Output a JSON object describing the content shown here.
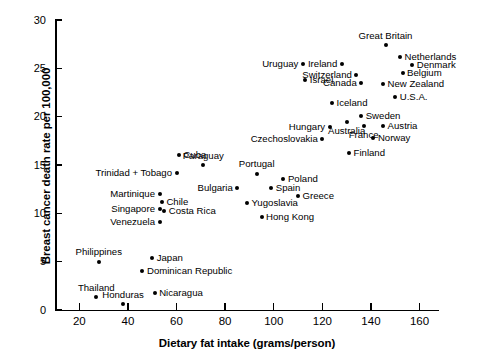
{
  "chart_data": {
    "type": "scatter",
    "title": "",
    "xlabel": "Dietary fat intake (grams/person)",
    "ylabel": "Breast cancer death rate per 100,000",
    "xlim": [
      10,
      168
    ],
    "ylim": [
      0,
      30
    ],
    "xticks": [
      20,
      40,
      60,
      80,
      100,
      120,
      140,
      160
    ],
    "yticks": [
      0,
      5,
      10,
      15,
      20,
      25,
      30
    ],
    "grid": false,
    "legend": null,
    "points": [
      {
        "label": "Great Britain",
        "x": 146,
        "y": 27.4,
        "lpos": "above"
      },
      {
        "label": "Netherlands",
        "x": 152,
        "y": 26.2,
        "lpos": "right"
      },
      {
        "label": "Denmark",
        "x": 157,
        "y": 25.3,
        "lpos": "right"
      },
      {
        "label": "Ireland",
        "x": 128,
        "y": 25.4,
        "lpos": "left"
      },
      {
        "label": "Belgium",
        "x": 153,
        "y": 24.5,
        "lpos": "right"
      },
      {
        "label": "Switzerland",
        "x": 134,
        "y": 24.3,
        "lpos": "left"
      },
      {
        "label": "Uruguay",
        "x": 112,
        "y": 25.4,
        "lpos": "left"
      },
      {
        "label": "Israel",
        "x": 113,
        "y": 23.8,
        "lpos": "right"
      },
      {
        "label": "Canada",
        "x": 136,
        "y": 23.5,
        "lpos": "left"
      },
      {
        "label": "New Zealand",
        "x": 145,
        "y": 23.4,
        "lpos": "right"
      },
      {
        "label": "U.S.A.",
        "x": 150,
        "y": 22.0,
        "lpos": "right"
      },
      {
        "label": "Iceland",
        "x": 124,
        "y": 21.4,
        "lpos": "right"
      },
      {
        "label": "Sweden",
        "x": 136,
        "y": 20.1,
        "lpos": "right"
      },
      {
        "label": "Austria",
        "x": 145,
        "y": 19.0,
        "lpos": "right"
      },
      {
        "label": "Australia",
        "x": 130,
        "y": 19.4,
        "lpos": "below"
      },
      {
        "label": "France",
        "x": 137,
        "y": 19.0,
        "lpos": "below"
      },
      {
        "label": "Hungary",
        "x": 123,
        "y": 18.9,
        "lpos": "left"
      },
      {
        "label": "Norway",
        "x": 141,
        "y": 17.8,
        "lpos": "right"
      },
      {
        "label": "Czechoslovakia",
        "x": 120,
        "y": 17.7,
        "lpos": "left"
      },
      {
        "label": "Finland",
        "x": 131,
        "y": 16.2,
        "lpos": "right"
      },
      {
        "label": "Cuba",
        "x": 61,
        "y": 16.0,
        "lpos": "right"
      },
      {
        "label": "Paraguay",
        "x": 71,
        "y": 15.0,
        "lpos": "above"
      },
      {
        "label": "Portugal",
        "x": 93,
        "y": 14.1,
        "lpos": "above"
      },
      {
        "label": "Poland",
        "x": 104,
        "y": 13.6,
        "lpos": "right"
      },
      {
        "label": "Trinidad + Tobago",
        "x": 60,
        "y": 14.2,
        "lpos": "left"
      },
      {
        "label": "Spain",
        "x": 99,
        "y": 12.6,
        "lpos": "right"
      },
      {
        "label": "Bulgaria",
        "x": 85,
        "y": 12.6,
        "lpos": "left"
      },
      {
        "label": "Greece",
        "x": 110,
        "y": 11.8,
        "lpos": "right"
      },
      {
        "label": "Martinique",
        "x": 53,
        "y": 12.0,
        "lpos": "left"
      },
      {
        "label": "Chile",
        "x": 54,
        "y": 11.2,
        "lpos": "right"
      },
      {
        "label": "Yugoslavia",
        "x": 89,
        "y": 11.1,
        "lpos": "right"
      },
      {
        "label": "Singapore",
        "x": 53,
        "y": 10.5,
        "lpos": "left"
      },
      {
        "label": "Costa Rica",
        "x": 55,
        "y": 10.2,
        "lpos": "right"
      },
      {
        "label": "Hong Kong",
        "x": 95,
        "y": 9.6,
        "lpos": "right"
      },
      {
        "label": "Venezuela",
        "x": 53,
        "y": 9.1,
        "lpos": "left"
      },
      {
        "label": "Philippines",
        "x": 28,
        "y": 5.0,
        "lpos": "above"
      },
      {
        "label": "Japan",
        "x": 50,
        "y": 5.4,
        "lpos": "right"
      },
      {
        "label": "Dominican Republic",
        "x": 46,
        "y": 4.0,
        "lpos": "right"
      },
      {
        "label": "Nicaragua",
        "x": 51,
        "y": 1.8,
        "lpos": "right"
      },
      {
        "label": "Thailand",
        "x": 27,
        "y": 1.3,
        "lpos": "above"
      },
      {
        "label": "Honduras",
        "x": 38,
        "y": 0.6,
        "lpos": "above"
      }
    ]
  }
}
